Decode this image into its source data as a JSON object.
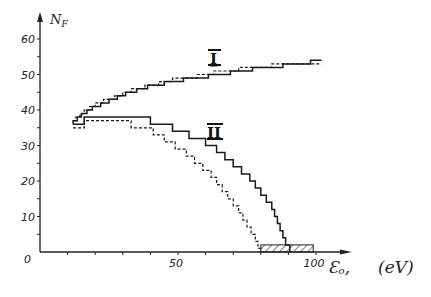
{
  "chart_data": {
    "type": "line",
    "step": true,
    "title": "",
    "xlabel": "E₀, (eV)",
    "ylabel": "N_F",
    "xlim": [
      0,
      110
    ],
    "ylim": [
      0,
      65
    ],
    "x_ticks": [
      0,
      10,
      20,
      30,
      40,
      50,
      60,
      70,
      80,
      90,
      100
    ],
    "x_tick_labels": {
      "0": "0",
      "50": "50",
      "100": "100"
    },
    "y_ticks": [
      0,
      5,
      10,
      15,
      20,
      25,
      30,
      35,
      40,
      45,
      50,
      55,
      60
    ],
    "y_tick_labels": {
      "0": "0",
      "10": "10",
      "20": "20",
      "30": "30",
      "40": "40",
      "50": "50",
      "60": "60"
    },
    "grid": false,
    "legend": null,
    "series": [
      {
        "name": "I (solid)",
        "group": "I",
        "style": "solid",
        "points": [
          [
            12,
            36
          ],
          [
            12,
            37
          ],
          [
            13.5,
            37
          ],
          [
            13.5,
            38
          ],
          [
            15,
            38
          ],
          [
            15,
            39
          ],
          [
            17,
            39
          ],
          [
            17,
            40
          ],
          [
            19,
            40
          ],
          [
            19,
            41
          ],
          [
            22,
            41
          ],
          [
            22,
            42
          ],
          [
            25,
            42
          ],
          [
            25,
            43
          ],
          [
            28,
            43
          ],
          [
            28,
            44
          ],
          [
            31,
            44
          ],
          [
            31,
            45
          ],
          [
            35,
            45
          ],
          [
            35,
            46
          ],
          [
            39,
            46
          ],
          [
            39,
            47
          ],
          [
            45,
            47
          ],
          [
            45,
            48
          ],
          [
            52,
            48
          ],
          [
            52,
            49
          ],
          [
            61,
            49
          ],
          [
            61,
            50
          ],
          [
            69,
            50
          ],
          [
            69,
            51
          ],
          [
            77,
            51
          ],
          [
            77,
            52
          ],
          [
            88,
            52
          ],
          [
            88,
            53
          ],
          [
            98,
            53
          ],
          [
            98,
            54
          ],
          [
            102,
            54
          ]
        ]
      },
      {
        "name": "I (dashed)",
        "group": "I",
        "style": "dashed",
        "points": [
          [
            12,
            37
          ],
          [
            13,
            37
          ],
          [
            13,
            38
          ],
          [
            14.5,
            38
          ],
          [
            14.5,
            39
          ],
          [
            16,
            39
          ],
          [
            16,
            40
          ],
          [
            18,
            40
          ],
          [
            18,
            41
          ],
          [
            20,
            41
          ],
          [
            20,
            42
          ],
          [
            23,
            42
          ],
          [
            23,
            43
          ],
          [
            27,
            43
          ],
          [
            27,
            44
          ],
          [
            30,
            44
          ],
          [
            30,
            45
          ],
          [
            33,
            45
          ],
          [
            33,
            46
          ],
          [
            38,
            46
          ],
          [
            38,
            47
          ],
          [
            43,
            47
          ],
          [
            43,
            48
          ],
          [
            48,
            48
          ],
          [
            48,
            49
          ],
          [
            57,
            49
          ],
          [
            57,
            50
          ],
          [
            63,
            50
          ],
          [
            63,
            51
          ],
          [
            72,
            51
          ],
          [
            72,
            52
          ],
          [
            84,
            52
          ],
          [
            84,
            53
          ],
          [
            102,
            53
          ]
        ]
      },
      {
        "name": "II (solid)",
        "group": "II",
        "style": "solid",
        "points": [
          [
            12,
            36
          ],
          [
            16,
            36
          ],
          [
            16,
            38
          ],
          [
            40,
            38
          ],
          [
            40,
            36
          ],
          [
            48,
            36
          ],
          [
            48,
            34
          ],
          [
            54,
            34
          ],
          [
            54,
            32
          ],
          [
            60,
            32
          ],
          [
            60,
            30
          ],
          [
            64,
            30
          ],
          [
            64,
            28
          ],
          [
            67,
            28
          ],
          [
            67,
            26
          ],
          [
            70,
            26
          ],
          [
            70,
            24
          ],
          [
            73,
            24
          ],
          [
            73,
            22
          ],
          [
            76,
            22
          ],
          [
            76,
            20
          ],
          [
            78,
            20
          ],
          [
            78,
            18
          ],
          [
            80,
            18
          ],
          [
            80,
            16
          ],
          [
            82,
            16
          ],
          [
            82,
            14
          ],
          [
            84,
            14
          ],
          [
            84,
            12
          ],
          [
            85,
            12
          ],
          [
            85,
            10
          ],
          [
            86,
            10
          ],
          [
            86,
            8
          ],
          [
            87,
            8
          ],
          [
            87,
            6
          ],
          [
            88,
            6
          ],
          [
            88,
            4
          ],
          [
            89,
            4
          ],
          [
            89,
            2
          ],
          [
            90.5,
            2
          ],
          [
            90.5,
            0
          ]
        ]
      },
      {
        "name": "II (dashed)",
        "group": "II",
        "style": "dashed",
        "points": [
          [
            12,
            35
          ],
          [
            16,
            35
          ],
          [
            16,
            37
          ],
          [
            33,
            37
          ],
          [
            33,
            35
          ],
          [
            41,
            35
          ],
          [
            41,
            33
          ],
          [
            45,
            33
          ],
          [
            45,
            31
          ],
          [
            49,
            31
          ],
          [
            49,
            29
          ],
          [
            53,
            29
          ],
          [
            53,
            27
          ],
          [
            56,
            27
          ],
          [
            56,
            25
          ],
          [
            59,
            25
          ],
          [
            59,
            23
          ],
          [
            62,
            23
          ],
          [
            62,
            21
          ],
          [
            64,
            21
          ],
          [
            64,
            19
          ],
          [
            66,
            19
          ],
          [
            66,
            17
          ],
          [
            68,
            17
          ],
          [
            68,
            15
          ],
          [
            70,
            15
          ],
          [
            70,
            13
          ],
          [
            72,
            13
          ],
          [
            72,
            11
          ],
          [
            73.5,
            11
          ],
          [
            73.5,
            9
          ],
          [
            75,
            9
          ],
          [
            75,
            7
          ],
          [
            76.5,
            7
          ],
          [
            76.5,
            5
          ],
          [
            78,
            5
          ],
          [
            78,
            3
          ],
          [
            79,
            3
          ],
          [
            79,
            1
          ],
          [
            80,
            1
          ],
          [
            80,
            0
          ]
        ]
      }
    ],
    "annotations": [
      {
        "text": "I",
        "x": 62,
        "y": 57
      },
      {
        "text": "II",
        "x": 63,
        "y": 40
      },
      {
        "type": "hatched_region",
        "x": [
          80,
          99
        ],
        "y": [
          0,
          2
        ]
      }
    ]
  },
  "labels": {
    "y_axis": "N",
    "y_axis_sub": "F",
    "x_axis_symbol": "Ɛ",
    "x_axis_sub": "o",
    "x_axis_comma": ",",
    "x_axis_unit": "(eV)",
    "curve_I": "I",
    "curve_II": "II"
  }
}
